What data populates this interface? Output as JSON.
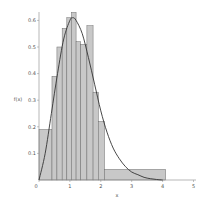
{
  "chart_data": {
    "type": "bar",
    "subtype": "histogram_with_density_curve",
    "title": "",
    "xlabel": "x",
    "ylabel": "f(x)",
    "xlim": [
      0,
      5
    ],
    "ylim": [
      0,
      0.65
    ],
    "xticks": [
      "0",
      "1",
      "2",
      "3",
      "4",
      "5"
    ],
    "yticks": [
      "0",
      "0.1",
      "0.2",
      "0.3",
      "0.4",
      "0.5",
      "0.6"
    ],
    "grid": false,
    "legend": null,
    "bins": [
      {
        "x0": 0.0,
        "x1": 0.42,
        "height": 0.19
      },
      {
        "x0": 0.42,
        "x1": 0.58,
        "height": 0.39
      },
      {
        "x0": 0.58,
        "x1": 0.75,
        "height": 0.5
      },
      {
        "x0": 0.75,
        "x1": 0.9,
        "height": 0.57
      },
      {
        "x0": 0.9,
        "x1": 1.05,
        "height": 0.61
      },
      {
        "x0": 1.05,
        "x1": 1.2,
        "height": 0.63
      },
      {
        "x0": 1.2,
        "x1": 1.35,
        "height": 0.52
      },
      {
        "x0": 1.35,
        "x1": 1.55,
        "height": 0.51
      },
      {
        "x0": 1.55,
        "x1": 1.75,
        "height": 0.58
      },
      {
        "x0": 1.75,
        "x1": 1.92,
        "height": 0.33
      },
      {
        "x0": 1.92,
        "x1": 2.12,
        "height": 0.22
      },
      {
        "x0": 2.12,
        "x1": 4.1,
        "height": 0.04
      }
    ],
    "series": [
      {
        "name": "density curve",
        "x": [
          0,
          0.2,
          0.4,
          0.6,
          0.8,
          1.0,
          1.1,
          1.2,
          1.4,
          1.6,
          1.8,
          2.0,
          2.2,
          2.4,
          2.6,
          2.8,
          3.0,
          3.2,
          3.4,
          3.6,
          3.8,
          4.0
        ],
        "values": [
          0,
          0.1,
          0.25,
          0.4,
          0.53,
          0.6,
          0.61,
          0.6,
          0.55,
          0.46,
          0.36,
          0.26,
          0.18,
          0.12,
          0.08,
          0.05,
          0.03,
          0.02,
          0.01,
          0.005,
          0.002,
          0.0
        ]
      }
    ],
    "colors": {
      "bar_fill": "#c8c8c8",
      "bar_stroke": "#6e6e6e",
      "curve": "#333333",
      "axis": "#888888"
    }
  }
}
